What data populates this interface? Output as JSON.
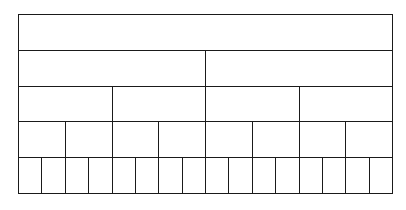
{
  "diagram": {
    "type": "fraction-wall",
    "line_color": "#1a1a1a",
    "background": "#ffffff",
    "rows": [
      {
        "divisions": 1
      },
      {
        "divisions": 2
      },
      {
        "divisions": 4
      },
      {
        "divisions": 8
      },
      {
        "divisions": 16
      }
    ]
  }
}
